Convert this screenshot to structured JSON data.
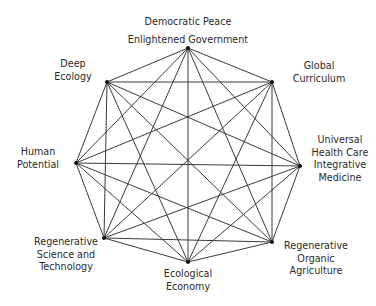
{
  "diagram": {
    "type": "complete-graph-octagon",
    "line_color": "#3a3a3a",
    "node_color": "#111111",
    "nodes": [
      {
        "id": "top",
        "x": 188,
        "y": 48,
        "lines": [
          "Democratic Peace",
          "Enlightened Government"
        ]
      },
      {
        "id": "top-right",
        "x": 272,
        "y": 82,
        "lines": [
          "Global",
          "Curriculum"
        ]
      },
      {
        "id": "right",
        "x": 300,
        "y": 166,
        "lines": [
          "Universal",
          "Health Care",
          "Integrative",
          "Medicine"
        ]
      },
      {
        "id": "bottom-right",
        "x": 272,
        "y": 242,
        "lines": [
          "Regenerative",
          "Organic",
          "Agriculture"
        ]
      },
      {
        "id": "bottom",
        "x": 188,
        "y": 262,
        "lines": [
          "Ecological",
          "Economy"
        ]
      },
      {
        "id": "bottom-left",
        "x": 104,
        "y": 238,
        "lines": [
          "Regenerative",
          "Science and",
          "Technology"
        ]
      },
      {
        "id": "left",
        "x": 76,
        "y": 163,
        "lines": [
          "Human",
          "Potential"
        ]
      },
      {
        "id": "top-left",
        "x": 107,
        "y": 82,
        "lines": [
          "Deep",
          "Ecology"
        ]
      }
    ]
  },
  "labels": {
    "top": {
      "l1": "Democratic Peace",
      "l2": "Enlightened Government"
    },
    "top_right": {
      "l1": "Global",
      "l2": "Curriculum"
    },
    "right": {
      "l1": "Universal",
      "l2": "Health Care",
      "l3": "Integrative",
      "l4": "Medicine"
    },
    "bottom_right": {
      "l1": "Regenerative",
      "l2": "Organic",
      "l3": "Agriculture"
    },
    "bottom": {
      "l1": "Ecological",
      "l2": "Economy"
    },
    "bottom_left": {
      "l1": "Regenerative",
      "l2": "Science and",
      "l3": "Technology"
    },
    "left": {
      "l1": "Human",
      "l2": "Potential"
    },
    "top_left": {
      "l1": "Deep",
      "l2": "Ecology"
    }
  }
}
